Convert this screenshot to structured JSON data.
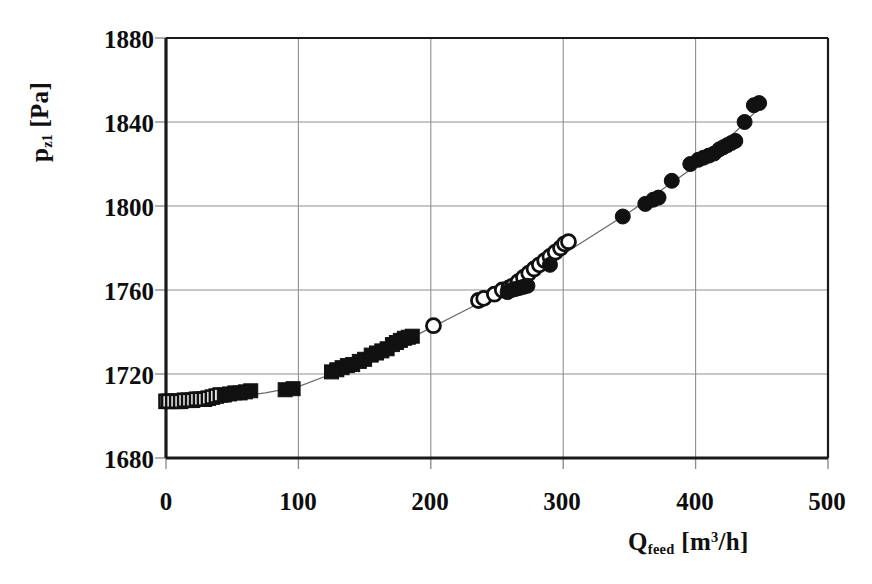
{
  "chart_data": {
    "type": "scatter",
    "title": "",
    "subtitle": "",
    "xlabel": "Q_feed [m^3/h]",
    "ylabel": "p_z1 [Pa]",
    "xlim": [
      0,
      500
    ],
    "ylim": [
      1680,
      1880
    ],
    "xticks": [
      0,
      100,
      200,
      300,
      400,
      500
    ],
    "yticks": [
      1680,
      1720,
      1760,
      1800,
      1840,
      1880
    ],
    "grid": true,
    "legend_position": "none",
    "annotations": [],
    "series": [
      {
        "name": "open-squares",
        "marker": "open-square",
        "x": [
          0,
          2,
          5,
          8,
          11,
          14,
          17,
          20,
          23,
          26,
          29,
          32,
          35,
          38,
          41
        ],
        "y": [
          1707,
          1707,
          1707,
          1707,
          1707,
          1707.5,
          1707.5,
          1707.5,
          1708,
          1708,
          1708,
          1708.5,
          1709,
          1709.5,
          1710
        ]
      },
      {
        "name": "filled-squares",
        "marker": "filled-square",
        "x": [
          44,
          48,
          52,
          56,
          60,
          64,
          90,
          96,
          125,
          129,
          133,
          137,
          141,
          146,
          150,
          155,
          159,
          163,
          167,
          171,
          174,
          177,
          180,
          183,
          186
        ],
        "y": [
          1710,
          1710.5,
          1711,
          1711,
          1711.5,
          1712,
          1712.5,
          1713,
          1721,
          1722,
          1723,
          1724,
          1724.5,
          1726,
          1727,
          1729,
          1730,
          1731,
          1732,
          1734,
          1735,
          1736,
          1737,
          1737.5,
          1738
        ]
      },
      {
        "name": "open-circles",
        "marker": "open-circle",
        "x": [
          202,
          236,
          240,
          248,
          254,
          259,
          262,
          266,
          270,
          274,
          278,
          282,
          286,
          290,
          294,
          298,
          301,
          304
        ],
        "y": [
          1743,
          1755,
          1756,
          1758,
          1760,
          1761,
          1762,
          1764,
          1766,
          1768,
          1770,
          1772,
          1774,
          1776,
          1778,
          1780,
          1782,
          1783
        ]
      },
      {
        "name": "filled-circles",
        "marker": "filled-circle",
        "x": [
          258,
          261,
          264,
          267,
          270,
          273,
          290,
          345,
          362,
          368,
          372,
          382,
          396,
          402,
          406,
          410,
          414,
          418,
          421,
          424,
          427,
          430,
          437,
          444,
          448
        ],
        "y": [
          1759,
          1760,
          1760.5,
          1761,
          1761.5,
          1762,
          1772,
          1795,
          1801,
          1803,
          1804,
          1812,
          1820,
          1822,
          1823,
          1824,
          1825,
          1827,
          1828,
          1829,
          1830,
          1831,
          1840,
          1848,
          1849
        ]
      }
    ],
    "fit_curve": {
      "name": "trend-line",
      "x": [
        0,
        25,
        50,
        75,
        100,
        125,
        150,
        175,
        200,
        225,
        250,
        275,
        300,
        325,
        350,
        375,
        400,
        425,
        450
      ],
      "y": [
        1707,
        1707.5,
        1709,
        1711,
        1714,
        1720,
        1727,
        1734,
        1742,
        1750,
        1758,
        1767,
        1777,
        1787,
        1797,
        1808,
        1819,
        1832,
        1848
      ]
    }
  },
  "axes": {
    "y_title_main": "p",
    "y_title_sub": "z1",
    "y_title_unit": " [Pa]",
    "x_title_main": "Q",
    "x_title_sub": "feed",
    "x_title_unit_pre": " [m",
    "x_title_unit_sup": "3",
    "x_title_unit_post": "/h]",
    "ytick_labels": [
      "1880",
      "1840",
      "1800",
      "1760",
      "1720",
      "1680"
    ],
    "xtick_labels": [
      "0",
      "100",
      "200",
      "300",
      "400",
      "500"
    ]
  },
  "colors": {
    "marker": "#111111",
    "axis": "#1a1a1a",
    "grid": "#8f8f8f",
    "curve": "#6a6a6a",
    "background": "#ffffff"
  }
}
